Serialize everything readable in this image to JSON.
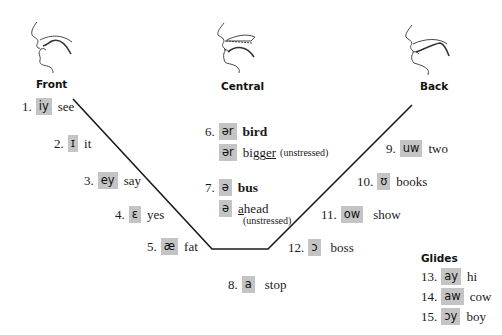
{
  "headers": {
    "front": "Front",
    "central": "Central",
    "back": "Back",
    "glides": "Glides"
  },
  "vowels": [
    {
      "num": "1.",
      "symbol": "iy",
      "word": "see"
    },
    {
      "num": "2.",
      "symbol": "ɪ",
      "word": "it"
    },
    {
      "num": "3.",
      "symbol": "ey",
      "word": "say"
    },
    {
      "num": "4.",
      "symbol": "ɛ",
      "word": "yes"
    },
    {
      "num": "5.",
      "symbol": "æ",
      "word": "fat"
    },
    {
      "num": "6.",
      "symbol": "ər",
      "word": "bird"
    },
    {
      "num": "",
      "symbol": "ər",
      "word_pre": "bigg",
      "word_u": "er",
      "note": "(unstressed)"
    },
    {
      "num": "7.",
      "symbol": "ə",
      "word": "bus"
    },
    {
      "num": "",
      "symbol": "ə",
      "word_u": "a",
      "word_post": "head",
      "note": "(unstressed)"
    },
    {
      "num": "8.",
      "symbol": "a",
      "word": "stop"
    },
    {
      "num": "9.",
      "symbol": "uw",
      "word": "two"
    },
    {
      "num": "10.",
      "symbol": "ʊ",
      "word": "books"
    },
    {
      "num": "11.",
      "symbol": "ow",
      "word": "show"
    },
    {
      "num": "12.",
      "symbol": "ɔ",
      "word": "boss"
    }
  ],
  "glides": [
    {
      "num": "13.",
      "symbol": "ay",
      "word": "hi"
    },
    {
      "num": "14.",
      "symbol": "aw",
      "word": "cow"
    },
    {
      "num": "15.",
      "symbol": "ɔy",
      "word": "boy"
    }
  ],
  "colors": {
    "symbol_bg": "#c4c4c4",
    "line": "#1a1a1a"
  }
}
